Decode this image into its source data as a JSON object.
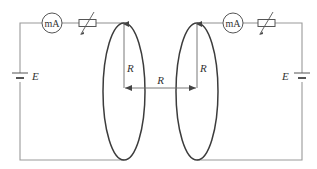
{
  "diagram": {
    "left_circuit": {
      "meter_label": "mA",
      "battery_label": "E",
      "coil_radius_label": "R"
    },
    "right_circuit": {
      "meter_label": "mA",
      "battery_label": "E",
      "coil_radius_label": "R"
    },
    "separation_label": "R",
    "colors": {
      "wire": "#9a9a9a",
      "coil": "#3c3c3c",
      "text": "#333333"
    }
  }
}
